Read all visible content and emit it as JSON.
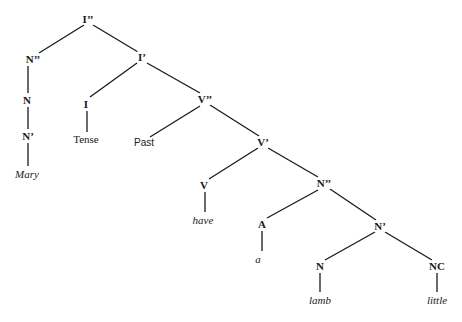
{
  "diagram": {
    "type": "syntax-tree",
    "nodes": [
      {
        "id": "Ipp",
        "label": "I’’",
        "kind": "cat",
        "x": 88,
        "y": 19
      },
      {
        "id": "Npp1",
        "label": "N’’",
        "kind": "cat",
        "x": 33,
        "y": 59
      },
      {
        "id": "Ip",
        "label": "I’",
        "kind": "cat",
        "x": 142,
        "y": 57
      },
      {
        "id": "N1",
        "label": "N",
        "kind": "cat",
        "x": 27,
        "y": 100
      },
      {
        "id": "Np1",
        "label": "N’",
        "kind": "cat",
        "x": 28,
        "y": 136
      },
      {
        "id": "Mary",
        "label": "Mary",
        "kind": "word",
        "x": 27,
        "y": 174
      },
      {
        "id": "I",
        "label": "I",
        "kind": "cat",
        "x": 86,
        "y": 104
      },
      {
        "id": "Tense",
        "label": "Tense",
        "kind": "feat-serif",
        "x": 86,
        "y": 139
      },
      {
        "id": "Vpp",
        "label": "V’’",
        "kind": "cat",
        "x": 205,
        "y": 99
      },
      {
        "id": "Past",
        "label": "Past",
        "kind": "feat",
        "x": 144,
        "y": 143
      },
      {
        "id": "Vp",
        "label": "V’",
        "kind": "cat",
        "x": 263,
        "y": 142
      },
      {
        "id": "V",
        "label": "V",
        "kind": "cat",
        "x": 204,
        "y": 185
      },
      {
        "id": "have",
        "label": "have",
        "kind": "word",
        "x": 203,
        "y": 220
      },
      {
        "id": "Npp2",
        "label": "N’’",
        "kind": "cat",
        "x": 324,
        "y": 183
      },
      {
        "id": "A",
        "label": "A",
        "kind": "cat",
        "x": 262,
        "y": 224
      },
      {
        "id": "a",
        "label": "a",
        "kind": "word",
        "x": 258,
        "y": 259
      },
      {
        "id": "Np2",
        "label": "N’",
        "kind": "cat",
        "x": 380,
        "y": 226
      },
      {
        "id": "N2",
        "label": "N",
        "kind": "cat",
        "x": 320,
        "y": 266
      },
      {
        "id": "lamb",
        "label": "lamb",
        "kind": "word",
        "x": 320,
        "y": 300
      },
      {
        "id": "NC",
        "label": "NC",
        "kind": "cat",
        "x": 437,
        "y": 266
      },
      {
        "id": "little",
        "label": "little",
        "kind": "word",
        "x": 437,
        "y": 300
      }
    ],
    "edges": [
      {
        "from": [
          84,
          25
        ],
        "to": [
          39,
          53
        ]
      },
      {
        "from": [
          93,
          25
        ],
        "to": [
          138,
          52
        ]
      },
      {
        "from": [
          28,
          66
        ],
        "to": [
          28,
          93
        ]
      },
      {
        "from": [
          28,
          107
        ],
        "to": [
          28,
          129
        ]
      },
      {
        "from": [
          28,
          143
        ],
        "to": [
          28,
          166
        ]
      },
      {
        "from": [
          137,
          63
        ],
        "to": [
          90,
          97
        ]
      },
      {
        "from": [
          147,
          63
        ],
        "to": [
          200,
          93
        ]
      },
      {
        "from": [
          87,
          111
        ],
        "to": [
          87,
          132
        ]
      },
      {
        "from": [
          200,
          106
        ],
        "to": [
          150,
          137
        ]
      },
      {
        "from": [
          210,
          105
        ],
        "to": [
          259,
          136
        ]
      },
      {
        "from": [
          258,
          148
        ],
        "to": [
          209,
          179
        ]
      },
      {
        "from": [
          268,
          148
        ],
        "to": [
          318,
          177
        ]
      },
      {
        "from": [
          205,
          192
        ],
        "to": [
          205,
          212
        ]
      },
      {
        "from": [
          318,
          190
        ],
        "to": [
          267,
          218
        ]
      },
      {
        "from": [
          330,
          189
        ],
        "to": [
          376,
          220
        ]
      },
      {
        "from": [
          262,
          231
        ],
        "to": [
          262,
          251
        ]
      },
      {
        "from": [
          375,
          232
        ],
        "to": [
          325,
          260
        ]
      },
      {
        "from": [
          385,
          232
        ],
        "to": [
          432,
          260
        ]
      },
      {
        "from": [
          320,
          273
        ],
        "to": [
          320,
          292
        ]
      },
      {
        "from": [
          437,
          273
        ],
        "to": [
          437,
          292
        ]
      }
    ]
  }
}
